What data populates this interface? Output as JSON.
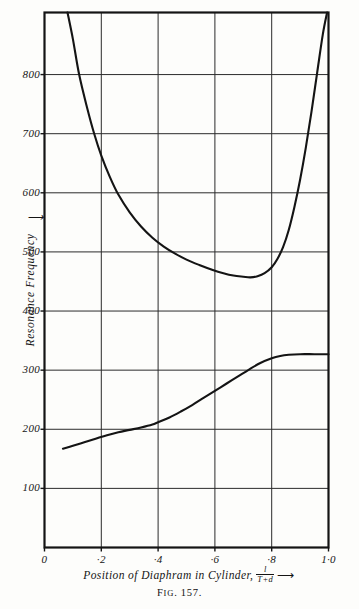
{
  "figure": {
    "caption_prefix": "F",
    "caption_smallcaps": "IG",
    "caption_number": ". 157."
  },
  "chart_data": {
    "type": "line",
    "title": "",
    "subtitle": "",
    "xlabel": "Position of Diaphram in Cylinder,",
    "xlabel_fraction_numerator": "l",
    "xlabel_fraction_denominator": "T+d",
    "xlabel_arrow": "⟶",
    "ylabel": "Resonance Frequency",
    "ylabel_arrow": "↑",
    "xlim": [
      0,
      1.0
    ],
    "ylim": [
      0,
      905
    ],
    "grid": true,
    "grid_x_step": 0.2,
    "grid_y_step": 100,
    "legend": "none",
    "xticks": [
      0,
      0.2,
      0.4,
      0.6,
      0.8,
      1.0
    ],
    "xticklabels": [
      "0",
      "·2",
      "·4",
      "·6",
      "·8",
      "1·0"
    ],
    "yticks": [
      100,
      200,
      300,
      400,
      500,
      600,
      700,
      800
    ],
    "yticklabels": [
      "100",
      "200",
      "300",
      "400",
      "500",
      "600",
      "700",
      "800"
    ],
    "series": [
      {
        "name": "upper-resonance-mode",
        "label": "",
        "points": [
          [
            0.081,
            905
          ],
          [
            0.1,
            860
          ],
          [
            0.122,
            800
          ],
          [
            0.15,
            744
          ],
          [
            0.175,
            700
          ],
          [
            0.2,
            663
          ],
          [
            0.23,
            627
          ],
          [
            0.26,
            597
          ],
          [
            0.3,
            567
          ],
          [
            0.34,
            543
          ],
          [
            0.38,
            524
          ],
          [
            0.42,
            509
          ],
          [
            0.46,
            497
          ],
          [
            0.5,
            487
          ],
          [
            0.545,
            478
          ],
          [
            0.59,
            470
          ],
          [
            0.63,
            464
          ],
          [
            0.665,
            460
          ],
          [
            0.7,
            458
          ],
          [
            0.725,
            457
          ],
          [
            0.75,
            459
          ],
          [
            0.775,
            464
          ],
          [
            0.8,
            474
          ],
          [
            0.82,
            488
          ],
          [
            0.84,
            508
          ],
          [
            0.86,
            537
          ],
          [
            0.88,
            576
          ],
          [
            0.9,
            622
          ],
          [
            0.92,
            676
          ],
          [
            0.94,
            737
          ],
          [
            0.96,
            803
          ],
          [
            0.98,
            868
          ],
          [
            0.995,
            905
          ]
        ]
      },
      {
        "name": "lower-resonance-mode",
        "label": "",
        "points": [
          [
            0.065,
            167
          ],
          [
            0.1,
            172
          ],
          [
            0.14,
            178
          ],
          [
            0.18,
            184
          ],
          [
            0.22,
            190
          ],
          [
            0.26,
            195
          ],
          [
            0.3,
            199
          ],
          [
            0.34,
            203
          ],
          [
            0.38,
            208
          ],
          [
            0.4,
            212
          ],
          [
            0.44,
            220
          ],
          [
            0.48,
            230
          ],
          [
            0.52,
            241
          ],
          [
            0.56,
            253
          ],
          [
            0.6,
            265
          ],
          [
            0.64,
            277
          ],
          [
            0.68,
            289
          ],
          [
            0.72,
            301
          ],
          [
            0.76,
            312
          ],
          [
            0.8,
            320
          ],
          [
            0.83,
            324
          ],
          [
            0.86,
            326
          ],
          [
            0.9,
            327
          ],
          [
            0.95,
            327
          ],
          [
            1.0,
            327
          ]
        ]
      }
    ],
    "annotations": []
  }
}
